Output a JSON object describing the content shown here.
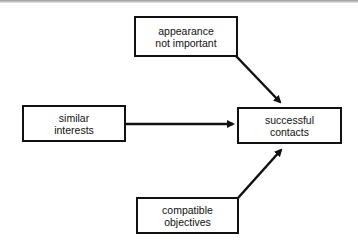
{
  "diagram": {
    "nodes": {
      "appearance": {
        "line1": "appearance",
        "line2": "not important"
      },
      "interests": {
        "line1": "similar",
        "line2": "interests"
      },
      "contacts": {
        "line1": "successful",
        "line2": "contacts"
      },
      "objectives": {
        "line1": "compatible",
        "line2": "objectives"
      }
    },
    "edges": [
      {
        "from": "appearance not important",
        "to": "successful contacts"
      },
      {
        "from": "similar interests",
        "to": "successful contacts"
      },
      {
        "from": "compatible objectives",
        "to": "successful contacts"
      }
    ],
    "colors": {
      "stroke": "#111111",
      "background": "#ffffff"
    }
  }
}
